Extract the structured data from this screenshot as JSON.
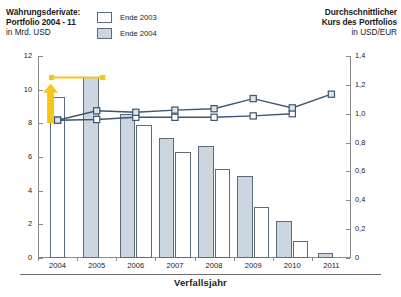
{
  "header": {
    "left_title_line1": "Währungsderivate:",
    "left_title_line2": "Portfolio 2004 - 11",
    "left_subtitle": "in Mrd. USD",
    "right_title_line1": "Durchschnittlicher",
    "right_title_line2": "Kurs des Portfolios",
    "right_subtitle": "in USD/EUR"
  },
  "legend": {
    "items": [
      {
        "label": "Ende 2003",
        "swatch": "white"
      },
      {
        "label": "Ende 2004",
        "swatch": "gray"
      }
    ]
  },
  "axes": {
    "x_title": "Verfallsjahr",
    "y_left_ticks": [
      "0",
      "2",
      "4",
      "6",
      "8",
      "10",
      "12"
    ],
    "y_right_ticks": [
      "0",
      "0,2",
      "0,4",
      "0,6",
      "0,8",
      "1,0",
      "1,2",
      "1,4"
    ]
  },
  "colors": {
    "bar_gray": "#ccd6e0",
    "bar_white": "#ffffff",
    "bar_border": "#5b6b7c",
    "line_dark": "#3d566e",
    "annotation_yellow": "#f5c518",
    "axis": "#8a8a8a"
  },
  "annotation": {
    "type": "up-arrow",
    "note_color": "#f5c518"
  },
  "chart_data": {
    "type": "bar",
    "title": "Währungsderivate: Portfolio 2004 - 11",
    "subtitle": "in Mrd. USD",
    "xlabel": "Verfallsjahr",
    "ylabel": "in Mrd. USD",
    "y2label": "in USD/EUR",
    "ylim": [
      0,
      12
    ],
    "y2lim": [
      0,
      1.4
    ],
    "grid": false,
    "legend_position": "top-center",
    "categories": [
      "2004",
      "2005",
      "2006",
      "2007",
      "2008",
      "2009",
      "2010",
      "2011"
    ],
    "series": [
      {
        "name": "Ende 2004",
        "kind": "bar",
        "axis": "left",
        "color": "#ccd6e0",
        "values": [
          null,
          10.75,
          8.55,
          7.15,
          6.65,
          4.9,
          2.2,
          0.3
        ]
      },
      {
        "name": "Ende 2003",
        "kind": "bar",
        "axis": "left",
        "color": "#ffffff",
        "values": [
          9.55,
          null,
          7.9,
          6.3,
          5.3,
          3.05,
          1.0,
          null
        ]
      },
      {
        "name": "Durchschnittlicher Kurs Ende 2003",
        "kind": "line",
        "axis": "right",
        "color": "#3d566e",
        "values": [
          0.955,
          0.96,
          0.975,
          0.975,
          0.975,
          0.985,
          1.0,
          null
        ]
      },
      {
        "name": "Durchschnittlicher Kurs Ende 2004",
        "kind": "line",
        "axis": "right",
        "color": "#3d566e",
        "values": [
          0.955,
          1.02,
          1.01,
          1.025,
          1.035,
          1.105,
          1.04,
          1.135
        ]
      }
    ],
    "annotations": [
      {
        "text": "",
        "type": "arrow-up",
        "color": "#f5c518",
        "at_category": "2004"
      }
    ]
  }
}
